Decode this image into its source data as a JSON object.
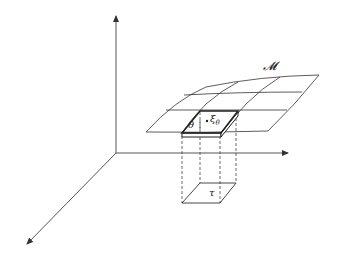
{
  "diagram": {
    "labels": {
      "manifold": "𝓜",
      "patch": "θ",
      "point": "ξ",
      "point_subscript": "θ",
      "projection": "τ"
    },
    "axes": {
      "origin": [
        116,
        153
      ],
      "vertical_end": [
        116,
        14
      ],
      "horizontal_end": [
        290,
        153
      ],
      "diagonal_end": [
        25,
        246
      ]
    },
    "colors": {
      "line": "#333333",
      "axis": "#555555",
      "background": "#ffffff"
    }
  }
}
